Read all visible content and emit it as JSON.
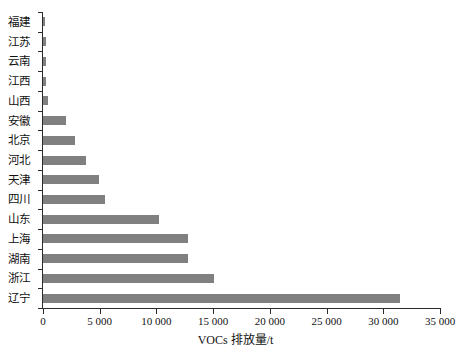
{
  "chart_data": {
    "type": "bar",
    "orientation": "horizontal",
    "title": "",
    "xlabel": "VOCs 排放量/t",
    "ylabel": "",
    "xlim": [
      0,
      35000
    ],
    "xticks": [
      0,
      5000,
      10000,
      15000,
      20000,
      25000,
      30000,
      35000
    ],
    "xtick_labels": [
      "0",
      "5 000",
      "10 000",
      "15 000",
      "20 000",
      "25 000",
      "30 000",
      "35 000"
    ],
    "grid": false,
    "legend": false,
    "bar_color": "#808080",
    "axis_color": "#2b2b2b",
    "categories": [
      "福建",
      "江苏",
      "云南",
      "江西",
      "山西",
      "安徽",
      "北京",
      "河北",
      "天津",
      "四川",
      "山东",
      "上海",
      "湖南",
      "浙江",
      "辽宁"
    ],
    "values": [
      150,
      250,
      280,
      300,
      450,
      2000,
      2800,
      3800,
      4900,
      5500,
      10200,
      12800,
      12800,
      15100,
      31500
    ],
    "series": [
      {
        "name": "VOCs 排放量",
        "values": [
          150,
          250,
          280,
          300,
          450,
          2000,
          2800,
          3800,
          4900,
          5500,
          10200,
          12800,
          12800,
          15100,
          31500
        ]
      }
    ]
  }
}
